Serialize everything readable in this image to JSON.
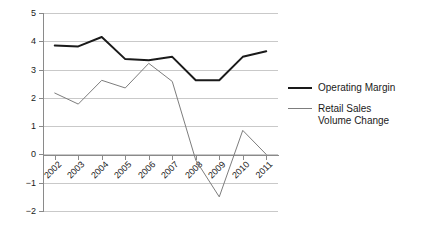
{
  "chart_data": {
    "type": "line",
    "title": "",
    "xlabel": "",
    "ylabel": "",
    "categories": [
      "2002",
      "2003",
      "2004",
      "2005",
      "2006",
      "2007",
      "2008",
      "2009",
      "2010",
      "2011"
    ],
    "series": [
      {
        "name": "Operating Margin",
        "color": "#1a1a1a",
        "line_width": 2,
        "values": [
          3.85,
          3.82,
          4.15,
          3.37,
          3.33,
          3.45,
          2.62,
          2.62,
          3.45,
          3.65
        ]
      },
      {
        "name": "Retail Sales Volume Change",
        "color": "#7d7d7d",
        "line_width": 1,
        "values": [
          2.17,
          1.78,
          2.62,
          2.35,
          3.22,
          2.58,
          -0.2,
          -1.5,
          0.85,
          0.0
        ]
      }
    ],
    "ylim": [
      -2,
      5
    ],
    "yticks": [
      5,
      4,
      3,
      2,
      1,
      0,
      -1,
      -2
    ],
    "ytick_labels": [
      "5",
      "4",
      "3",
      "2",
      "1",
      "0",
      "−1",
      "−2"
    ],
    "grid": true,
    "grid_axis": "y",
    "legend_position": "right",
    "xtick_rotation": -45
  },
  "legend": {
    "entries": [
      {
        "label": "Operating Margin"
      },
      {
        "label": "Retail Sales\nVolume Change"
      }
    ]
  }
}
